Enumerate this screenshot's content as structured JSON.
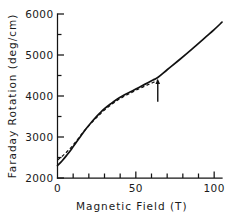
{
  "chart_data": {
    "type": "line",
    "title": "",
    "xlabel": "Magnetic Field  (T)",
    "ylabel": "Faraday Rotation  (deg/cm)",
    "xlim": [
      0,
      105
    ],
    "ylim": [
      2000,
      6000
    ],
    "grid": false,
    "legend_position": "none",
    "x_ticks_major": [
      0,
      50,
      100
    ],
    "x_ticks_major_labels": [
      "0",
      "50",
      "100"
    ],
    "x_ticks_minor": [
      10,
      20,
      30,
      40,
      60,
      70,
      80,
      90
    ],
    "y_ticks_major": [
      2000,
      3000,
      4000,
      5000,
      6000
    ],
    "y_ticks_major_labels": [
      "2000",
      "3000",
      "4000",
      "5000",
      "6000"
    ],
    "y_ticks_minor": [
      2500,
      3500,
      4500,
      5500
    ],
    "annotations": [
      {
        "name": "transition-arrow",
        "x": 64,
        "y_tip": 4420,
        "y_tail": 3860,
        "direction": "up",
        "label": ""
      }
    ],
    "series": [
      {
        "name": "experiment",
        "style": "solid",
        "x": [
          0,
          3,
          6,
          9,
          12,
          15,
          18,
          21,
          24,
          27,
          30,
          34,
          38,
          42,
          46,
          50,
          54,
          58,
          61,
          64,
          70,
          78,
          86,
          94,
          100,
          105
        ],
        "y": [
          2300,
          2420,
          2560,
          2710,
          2870,
          3030,
          3190,
          3330,
          3460,
          3580,
          3690,
          3810,
          3920,
          4010,
          4090,
          4170,
          4250,
          4330,
          4390,
          4450,
          4640,
          4890,
          5150,
          5420,
          5620,
          5800
        ]
      },
      {
        "name": "theory",
        "style": "dashed",
        "x": [
          0,
          3,
          6,
          9,
          12,
          15,
          18,
          21,
          24,
          27,
          30,
          34,
          38,
          42,
          46,
          50,
          54,
          58,
          61,
          64
        ],
        "y": [
          2440,
          2530,
          2640,
          2760,
          2900,
          3050,
          3190,
          3320,
          3440,
          3550,
          3660,
          3780,
          3890,
          3980,
          4060,
          4140,
          4210,
          4280,
          4330,
          4380
        ]
      }
    ]
  }
}
